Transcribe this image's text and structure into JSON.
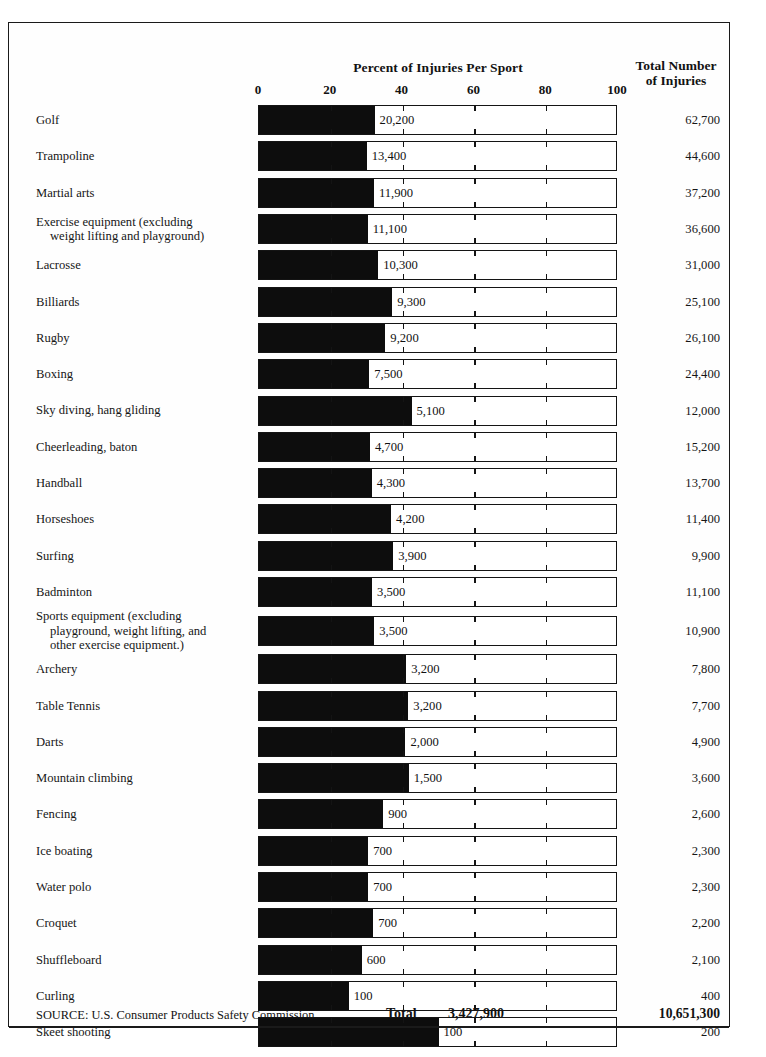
{
  "header": {
    "chart_title": "Percent of Injuries Per Sport",
    "totals_title_line1": "Total Number",
    "totals_title_line2": "of Injuries"
  },
  "footer": {
    "source": "SOURCE: U.S. Consumer Products Safety Commission.",
    "total_word": "Total",
    "total_percent_column": "3,427,900",
    "total_injuries_column": "10,651,300"
  },
  "chart_data": {
    "type": "bar",
    "orientation": "horizontal",
    "title": "Percent of Injuries Per Sport",
    "xlabel": "",
    "ylabel": "",
    "xlim": [
      0,
      100
    ],
    "xticks": [
      0,
      20,
      40,
      60,
      80,
      100
    ],
    "xtick_labels": [
      "0",
      "20",
      "40",
      "60",
      "80",
      "100"
    ],
    "grid": false,
    "legend": "none",
    "series_name": "Percent of Injuries Per Sport",
    "value_column_header": "Total Number of Injuries",
    "categories": [
      "Golf",
      "Trampoline",
      "Martial arts",
      "Exercise equipment (excluding weight lifting and playground)",
      "Lacrosse",
      "Billiards",
      "Rugby",
      "Boxing",
      "Sky diving, hang gliding",
      "Cheerleading, baton",
      "Handball",
      "Horseshoes",
      "Surfing",
      "Badminton",
      "Sports equipment (excluding playground, weight lifting, and other exercise equipment.)",
      "Archery",
      "Table Tennis",
      "Darts",
      "Mountain climbing",
      "Fencing",
      "Ice boating",
      "Water polo",
      "Croquet",
      "Shuffleboard",
      "Curling",
      "Skeet shooting"
    ],
    "values": [
      32.2,
      30.0,
      32.0,
      30.3,
      33.2,
      37.1,
      35.2,
      30.7,
      42.5,
      30.9,
      31.4,
      36.8,
      37.4,
      31.5,
      32.1,
      41.0,
      41.6,
      40.8,
      41.7,
      34.6,
      30.4,
      30.4,
      31.8,
      28.6,
      25.0,
      50.0
    ],
    "data_labels": [
      "20,200",
      "13,400",
      "11,900",
      "11,100",
      "10,300",
      "9,300",
      "9,200",
      "7,500",
      "5,100",
      "4,700",
      "4,300",
      "4,200",
      "3,900",
      "3,500",
      "3,500",
      "3,200",
      "3,200",
      "2,000",
      "1,500",
      "900",
      "700",
      "700",
      "700",
      "600",
      "100",
      "100"
    ],
    "totals": [
      "62,700",
      "44,600",
      "37,200",
      "36,600",
      "31,000",
      "25,100",
      "26,100",
      "24,400",
      "12,000",
      "15,200",
      "13,700",
      "11,400",
      "9,900",
      "11,100",
      "10,900",
      "7,800",
      "7,700",
      "4,900",
      "3,600",
      "2,600",
      "2,300",
      "2,300",
      "2,200",
      "2,100",
      "400",
      "200"
    ],
    "total_data_labels": "3,427,900",
    "total_totals": "10,651,300"
  },
  "rows": [
    {
      "label_lines": [
        "Golf"
      ],
      "value": "20,200",
      "total": "62,700",
      "percent": 32.2
    },
    {
      "label_lines": [
        "Trampoline"
      ],
      "value": "13,400",
      "total": "44,600",
      "percent": 30.0
    },
    {
      "label_lines": [
        "Martial arts"
      ],
      "value": "11,900",
      "total": "37,200",
      "percent": 32.0
    },
    {
      "label_lines": [
        "Exercise equipment (excluding",
        "weight lifting and playground)"
      ],
      "value": "11,100",
      "total": "36,600",
      "percent": 30.3
    },
    {
      "label_lines": [
        "Lacrosse"
      ],
      "value": "10,300",
      "total": "31,000",
      "percent": 33.2
    },
    {
      "label_lines": [
        "Billiards"
      ],
      "value": "9,300",
      "total": "25,100",
      "percent": 37.1
    },
    {
      "label_lines": [
        "Rugby"
      ],
      "value": "9,200",
      "total": "26,100",
      "percent": 35.2
    },
    {
      "label_lines": [
        "Boxing"
      ],
      "value": "7,500",
      "total": "24,400",
      "percent": 30.7
    },
    {
      "label_lines": [
        "Sky diving, hang gliding"
      ],
      "value": "5,100",
      "total": "12,000",
      "percent": 42.5
    },
    {
      "label_lines": [
        "Cheerleading, baton"
      ],
      "value": "4,700",
      "total": "15,200",
      "percent": 30.9
    },
    {
      "label_lines": [
        "Handball"
      ],
      "value": "4,300",
      "total": "13,700",
      "percent": 31.4
    },
    {
      "label_lines": [
        "Horseshoes"
      ],
      "value": "4,200",
      "total": "11,400",
      "percent": 36.8
    },
    {
      "label_lines": [
        "Surfing"
      ],
      "value": "3,900",
      "total": "9,900",
      "percent": 37.4
    },
    {
      "label_lines": [
        "Badminton"
      ],
      "value": "3,500",
      "total": "11,100",
      "percent": 31.5
    },
    {
      "label_lines": [
        "Sports equipment (excluding",
        "playground, weight lifting, and",
        "other exercise equipment.)"
      ],
      "value": "3,500",
      "total": "10,900",
      "percent": 32.1
    },
    {
      "label_lines": [
        "Archery"
      ],
      "value": "3,200",
      "total": "7,800",
      "percent": 41.0
    },
    {
      "label_lines": [
        "Table Tennis"
      ],
      "value": "3,200",
      "total": "7,700",
      "percent": 41.6
    },
    {
      "label_lines": [
        "Darts"
      ],
      "value": "2,000",
      "total": "4,900",
      "percent": 40.8
    },
    {
      "label_lines": [
        "Mountain climbing"
      ],
      "value": "1,500",
      "total": "3,600",
      "percent": 41.7
    },
    {
      "label_lines": [
        "Fencing"
      ],
      "value": "900",
      "total": "2,600",
      "percent": 34.6
    },
    {
      "label_lines": [
        "Ice boating"
      ],
      "value": "700",
      "total": "2,300",
      "percent": 30.4
    },
    {
      "label_lines": [
        "Water polo"
      ],
      "value": "700",
      "total": "2,300",
      "percent": 30.4
    },
    {
      "label_lines": [
        "Croquet"
      ],
      "value": "700",
      "total": "2,200",
      "percent": 31.8
    },
    {
      "label_lines": [
        "Shuffleboard"
      ],
      "value": "600",
      "total": "2,100",
      "percent": 28.6
    },
    {
      "label_lines": [
        "Curling"
      ],
      "value": "100",
      "total": "400",
      "percent": 25.0
    },
    {
      "label_lines": [
        "Skeet shooting"
      ],
      "value": "100",
      "total": "200",
      "percent": 50.0
    }
  ],
  "axis": {
    "ticks": [
      {
        "label": "0",
        "pos": 0
      },
      {
        "label": "20",
        "pos": 20
      },
      {
        "label": "40",
        "pos": 40
      },
      {
        "label": "60",
        "pos": 60
      },
      {
        "label": "80",
        "pos": 80
      },
      {
        "label": "100",
        "pos": 100
      }
    ]
  }
}
